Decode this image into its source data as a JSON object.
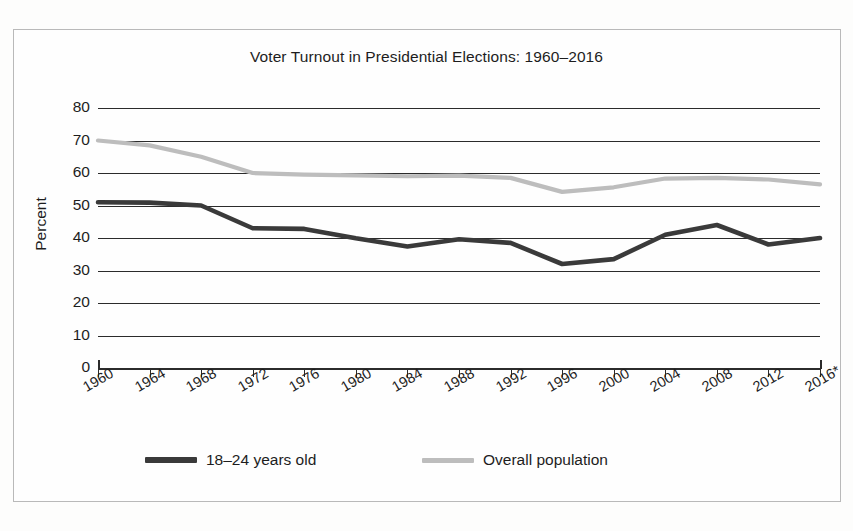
{
  "chart_data": {
    "type": "line",
    "title": "Voter Turnout in Presidential Elections: 1960–2016",
    "xlabel": "",
    "ylabel": "Percent",
    "ylim": [
      0,
      80
    ],
    "ytick_step": 10,
    "grid": true,
    "legend_position": "bottom",
    "x": [
      1960,
      1964,
      1968,
      1972,
      1976,
      1980,
      1984,
      1988,
      1992,
      1996,
      2000,
      2004,
      2008,
      2012,
      2016
    ],
    "categories": [
      "1960",
      "1964",
      "1968",
      "1972",
      "1976",
      "1980",
      "1984",
      "1988",
      "1992",
      "1996",
      "2000",
      "2004",
      "2008",
      "2012",
      "2016*"
    ],
    "yticks": [
      "0",
      "10",
      "20",
      "30",
      "40",
      "50",
      "60",
      "70",
      "80"
    ],
    "series": [
      {
        "name": "18–24 years old",
        "color": "#3a3a3a",
        "values": [
          51.0,
          50.9,
          50.0,
          43.0,
          42.8,
          39.9,
          37.4,
          39.6,
          38.5,
          32.0,
          33.5,
          41.0,
          44.0,
          38.0,
          40.0
        ]
      },
      {
        "name": "Overall population",
        "color": "#bdbdbd",
        "values": [
          70.0,
          68.5,
          65.0,
          60.0,
          59.5,
          59.3,
          59.0,
          59.2,
          58.5,
          54.2,
          55.6,
          58.3,
          58.5,
          58.0,
          56.5
        ]
      }
    ],
    "note": "2016*"
  },
  "legend": {
    "youth_label": "18–24 years old",
    "overall_label": "Overall population"
  }
}
